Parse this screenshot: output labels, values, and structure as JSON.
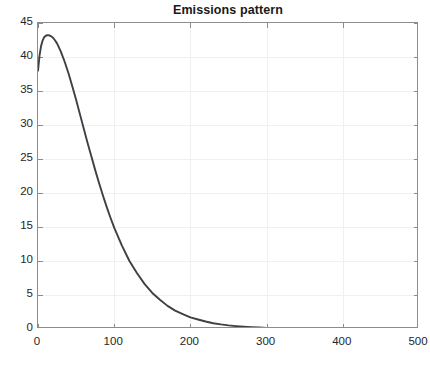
{
  "figure": {
    "title": "Emissions pattern",
    "background_color": "#ffffff",
    "axis_color": "#8c8c8c",
    "grid_color": "#f0f0f0",
    "line_color": "#3f3f46"
  },
  "chart_data": {
    "type": "line",
    "title": "Emissions pattern",
    "xlabel": "",
    "ylabel": "",
    "xlim": [
      0,
      500
    ],
    "ylim": [
      0,
      45
    ],
    "grid": true,
    "legend": null,
    "xticks": [
      0,
      100,
      200,
      300,
      400,
      500
    ],
    "yticks": [
      0,
      5,
      10,
      15,
      20,
      25,
      30,
      35,
      40,
      45
    ],
    "series": [
      {
        "name": "Emissions pattern",
        "color": "#3f3f46",
        "x": [
          0,
          2,
          4,
          6,
          8,
          10,
          12,
          14,
          16,
          18,
          20,
          22,
          25,
          30,
          35,
          40,
          45,
          50,
          55,
          60,
          65,
          70,
          75,
          80,
          85,
          90,
          95,
          100,
          110,
          120,
          130,
          140,
          150,
          160,
          170,
          180,
          190,
          200,
          210,
          220,
          230,
          240,
          250,
          260,
          270,
          280,
          290,
          300,
          320,
          340,
          360,
          380,
          400,
          420,
          440,
          460,
          480,
          500
        ],
        "y": [
          38.0,
          40.2,
          41.6,
          42.4,
          42.9,
          43.1,
          43.2,
          43.2,
          43.1,
          43.0,
          42.8,
          42.5,
          42.0,
          40.8,
          39.3,
          37.6,
          35.7,
          33.7,
          31.6,
          29.5,
          27.4,
          25.4,
          23.4,
          21.5,
          19.7,
          18.0,
          16.4,
          14.9,
          12.3,
          10.0,
          8.2,
          6.6,
          5.3,
          4.3,
          3.4,
          2.7,
          2.2,
          1.7,
          1.4,
          1.1,
          0.85,
          0.68,
          0.54,
          0.43,
          0.34,
          0.27,
          0.21,
          0.17,
          0.11,
          0.07,
          0.05,
          0.03,
          0.02,
          0.015,
          0.01,
          0.008,
          0.005,
          0.004
        ]
      }
    ],
    "annotations": {
      "peak_x": 13,
      "peak_y": 43.2,
      "start_y": 38.0
    }
  }
}
